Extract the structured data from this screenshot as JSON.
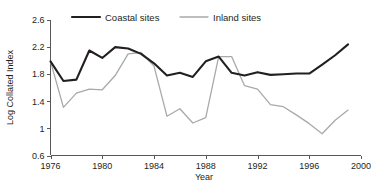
{
  "chart_data": {
    "type": "line",
    "title": "",
    "xlabel": "Year",
    "ylabel": "Log Collated Index",
    "xlim": [
      1976,
      2000
    ],
    "ylim": [
      0.6,
      2.6
    ],
    "xticks": [
      1976,
      1980,
      1984,
      1988,
      1992,
      1996,
      2000
    ],
    "yticks": [
      0.6,
      1,
      1.4,
      1.8,
      2.2,
      2.6
    ],
    "grid": false,
    "legend_position": "top-center",
    "x": [
      1976,
      1977,
      1978,
      1979,
      1980,
      1981,
      1982,
      1983,
      1984,
      1985,
      1986,
      1987,
      1988,
      1989,
      1990,
      1991,
      1992,
      1993,
      1994,
      1995,
      1996,
      1997,
      1998,
      1999
    ],
    "series": [
      {
        "name": "Coastal sites",
        "color": "#231f20",
        "values": [
          1.99,
          1.7,
          1.72,
          2.15,
          2.04,
          2.2,
          2.18,
          2.1,
          1.96,
          1.78,
          1.82,
          1.76,
          1.99,
          2.06,
          1.82,
          1.78,
          1.83,
          1.79,
          1.8,
          1.81,
          1.81,
          1.94,
          2.08,
          2.24
        ]
      },
      {
        "name": "Inland sites",
        "color": "#a7a9ac",
        "values": [
          1.99,
          1.31,
          1.52,
          1.58,
          1.57,
          1.78,
          2.1,
          2.12,
          1.92,
          1.18,
          1.29,
          1.08,
          1.16,
          2.06,
          2.06,
          1.63,
          1.58,
          1.35,
          1.32,
          1.2,
          1.07,
          0.92,
          1.12,
          1.27
        ]
      }
    ]
  },
  "legend": {
    "items": [
      {
        "label": "Coastal sites",
        "color": "#231f20"
      },
      {
        "label": "Inland sites",
        "color": "#a7a9ac"
      }
    ]
  },
  "axes": {
    "y_title": "Log Collated Index",
    "x_title": "Year",
    "y_tick_labels": [
      "2.6",
      "2.2",
      "1.8",
      "1.4",
      "1",
      "0.6"
    ],
    "x_tick_labels": [
      "1976",
      "1980",
      "1984",
      "1988",
      "1992",
      "1996",
      "2000"
    ]
  }
}
